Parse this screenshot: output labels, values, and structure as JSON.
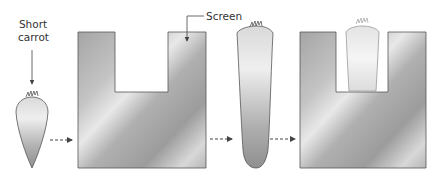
{
  "labels": {
    "short_carrot_line1": "Short",
    "short_carrot_line2": "carrot",
    "screen": "Screen"
  },
  "colors": {
    "outline": "#555555",
    "metal_dark": "#9a9a9a",
    "metal_light": "#e6e6e6",
    "arrow": "#444444"
  }
}
